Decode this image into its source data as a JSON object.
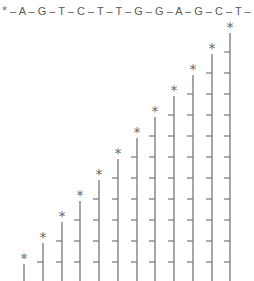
{
  "sequence": {
    "label_marker": "*",
    "bases": [
      "A",
      "G",
      "T",
      "C",
      "T",
      "T",
      "G",
      "G",
      "A",
      "G",
      "C",
      "T"
    ],
    "separator": " – ",
    "end_label": "3'"
  },
  "ladder": {
    "marker": "*",
    "fragment_count": 12,
    "fragments": [
      {
        "length": 1,
        "x": 24
      },
      {
        "length": 2,
        "x": 43
      },
      {
        "length": 3,
        "x": 62
      },
      {
        "length": 4,
        "x": 80
      },
      {
        "length": 5,
        "x": 99
      },
      {
        "length": 6,
        "x": 118
      },
      {
        "length": 7,
        "x": 137
      },
      {
        "length": 8,
        "x": 155
      },
      {
        "length": 9,
        "x": 174
      },
      {
        "length": 10,
        "x": 193
      },
      {
        "length": 11,
        "x": 212
      },
      {
        "length": 12,
        "x": 230
      }
    ],
    "line_color": "#777777",
    "marker_color": "#666666"
  }
}
